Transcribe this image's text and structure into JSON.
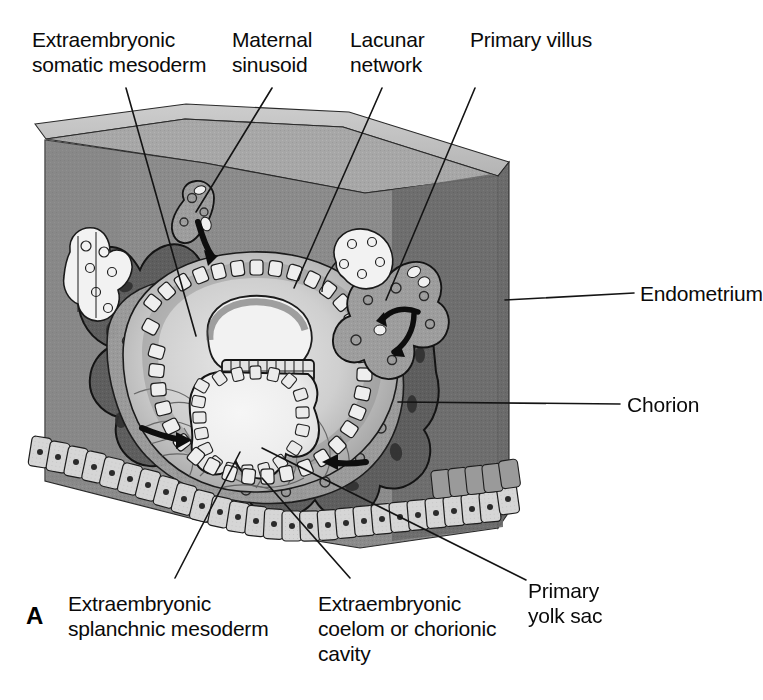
{
  "figure": {
    "panel_letter": "A",
    "caption_subject": "Implantation site cut-away block diagram",
    "colors": {
      "endometrium_front": "#8b8b8b",
      "endometrium_right": "#6b6b6b",
      "endometrium_top": "#a9a9a9",
      "endometrium_top_bevel": "#c9c9c9",
      "syncytiotrophoblast": "#5e5e5e",
      "cytotrophoblast": "#9a9a9a",
      "lacuna": "#7d7d7d",
      "chorionic_cavity": "#c6c6c6",
      "yolk_sac_lumen": "#efefef",
      "amniotic_cavity": "#f2f2f2",
      "epithelium_cells": "#d8d8d8",
      "outline": "#151515",
      "leader_line": "#1a1a1a",
      "label_text": "#0a0a0a",
      "background": "#ffffff"
    }
  },
  "labels": {
    "extraembryonic_somatic_mesoderm": {
      "line1": "Extraembryonic",
      "line2": "somatic mesoderm"
    },
    "maternal_sinusoid": {
      "line1": "Maternal",
      "line2": "sinusoid"
    },
    "lacunar_network": {
      "line1": "Lacunar",
      "line2": "network"
    },
    "primary_villus": {
      "line1": "Primary villus"
    },
    "endometrium": {
      "line1": "Endometrium"
    },
    "chorion": {
      "line1": "Chorion"
    },
    "primary_yolk_sac": {
      "line1": "Primary",
      "line2": "yolk sac"
    },
    "extraembryonic_coelom": {
      "line1": "Extraembryonic",
      "line2": "coelom or chorionic",
      "line3": "cavity"
    },
    "extraembryonic_splanchnic_mesoderm": {
      "line1": "Extraembryonic",
      "line2": "splanchnic mesoderm"
    }
  }
}
